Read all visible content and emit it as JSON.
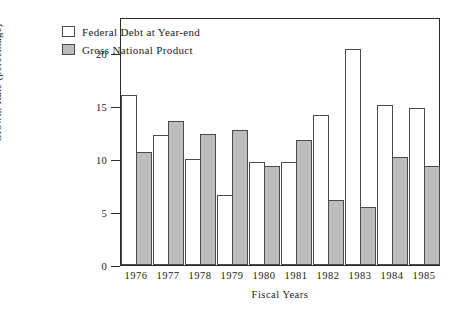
{
  "chart_data": {
    "type": "bar",
    "title": "",
    "xlabel": "Fiscal Years",
    "ylabel": "Growth Rate (percentage)",
    "categories": [
      "1976",
      "1977",
      "1978",
      "1979",
      "1980",
      "1981",
      "1982",
      "1983",
      "1984",
      "1985"
    ],
    "series": [
      {
        "name": "Federal Debt at Year-end",
        "color": "#ffffff",
        "values": [
          16.0,
          12.3,
          10.0,
          6.6,
          9.7,
          9.7,
          14.2,
          20.4,
          15.1,
          14.8
        ]
      },
      {
        "name": "Gross National Product",
        "color": "#bdbdbd",
        "values": [
          10.7,
          13.6,
          12.4,
          12.7,
          9.3,
          11.8,
          6.1,
          5.5,
          10.2,
          9.3
        ]
      }
    ],
    "ylim": [
      0,
      23.4
    ],
    "yticks": [
      0,
      5,
      10,
      15,
      20
    ],
    "ytick_labels": [
      "0",
      "5",
      "10",
      "15",
      "20"
    ],
    "grid": false,
    "legend_position": "top-left-outside-plot"
  },
  "legend": {
    "items": [
      {
        "label": "Federal Debt at Year-end",
        "swatch": "open-white-box"
      },
      {
        "label": "Gross National Product",
        "swatch": "filled-gray-box"
      }
    ]
  },
  "colors": {
    "bar_debt_fill": "#ffffff",
    "bar_gnp_fill": "#bdbdbd",
    "bar_border": "#4a4a4a",
    "axis": "#2b2b2b",
    "text": "#1a1a1a",
    "background": "#ffffff"
  }
}
